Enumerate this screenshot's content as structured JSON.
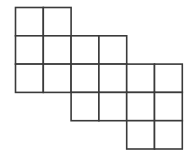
{
  "diagram": {
    "type": "square-grid-polyomino",
    "grid": {
      "origin_x": 15.5,
      "origin_y": 7.5,
      "cell_width": 27.8,
      "cell_height": 28.3,
      "line_color": "#3a3a3a",
      "fill_color": "#ffffff"
    },
    "rows": [
      {
        "row": 0,
        "cols": [
          0,
          1
        ]
      },
      {
        "row": 1,
        "cols": [
          0,
          1,
          2,
          3
        ]
      },
      {
        "row": 2,
        "cols": [
          0,
          1,
          2,
          3,
          4,
          5
        ]
      },
      {
        "row": 3,
        "cols": [
          2,
          3,
          4,
          5
        ]
      },
      {
        "row": 4,
        "cols": [
          4,
          5
        ]
      }
    ],
    "cell_count": 18
  }
}
